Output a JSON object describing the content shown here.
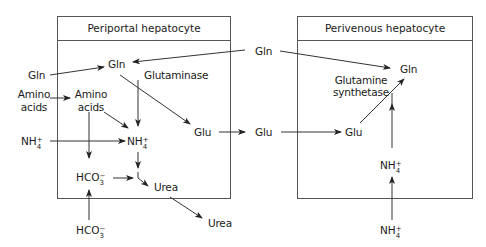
{
  "boxes": {
    "periportal": {
      "title": "Periportal hepatocyte"
    },
    "perivenous": {
      "title": "Perivenous hepatocyte"
    }
  },
  "labels": {
    "gln_outside_left": "Gln",
    "gln_periportal": "Gln",
    "glutaminase": "Glutaminase",
    "amino_acids_outside_1": "Amino",
    "amino_acids_outside_2": "acids",
    "amino_acids_inside_1": "Amino",
    "amino_acids_inside_2": "acids",
    "glu_periportal": "Glu",
    "glu_between": "Glu",
    "glu_perivenous": "Glu",
    "gln_between": "Gln",
    "gln_perivenous": "Gln",
    "glutamine_synthetase_1": "Glutamine",
    "glutamine_synthetase_2": "synthetase",
    "urea_inside": "Urea",
    "urea_outside": "Urea"
  },
  "ions": {
    "nh4_outside_left": {
      "base": "NH",
      "sup": "+",
      "sub": "4"
    },
    "nh4_periportal": {
      "base": "NH",
      "sup": "+",
      "sub": "4"
    },
    "hco3_inside": {
      "base": "HCO",
      "sup": "−",
      "sub": "3"
    },
    "hco3_outside": {
      "base": "HCO",
      "sup": "−",
      "sub": "3"
    },
    "nh4_perivenous": {
      "base": "NH",
      "sup": "+",
      "sub": "4"
    },
    "nh4_outside_bottom": {
      "base": "NH",
      "sup": "+",
      "sub": "4"
    }
  },
  "colors": {
    "line": "#333333",
    "box": "#555555",
    "text": "#1a1a1a"
  }
}
